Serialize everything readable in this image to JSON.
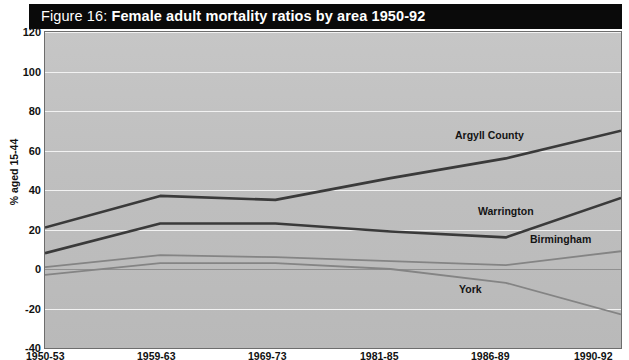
{
  "figure": {
    "title_prefix": "Figure 16: ",
    "title_main": "Female adult mortality ratios by area 1950-92"
  },
  "axes": {
    "y_axis_title": "% aged 15-44",
    "y_ticks": [
      "120",
      "100",
      "80",
      "60",
      "40",
      "20",
      "0",
      "-20",
      "-40"
    ],
    "x_ticks": [
      "1950-53",
      "1959-63",
      "1969-73",
      "1981-85",
      "1986-89",
      "1990-92"
    ]
  },
  "series_labels": {
    "argyll": "Argyll County",
    "warrington": "Warrington",
    "birmingham": "Birmingham",
    "york": "York"
  },
  "colors": {
    "plot_background": "#c0c0c0",
    "gridline": "#f2f2f2",
    "zero_line": "#909090",
    "frame": "#6d6d6d",
    "banner": "#0a0a0a",
    "banner_text": "#ffffff",
    "dark_series": "#3a3a3a",
    "mid_series": "#808080"
  },
  "chart_data": {
    "type": "line",
    "title": "Figure 16: Female adult mortality ratios by area 1950-92",
    "xlabel": "",
    "ylabel": "% aged 15-44",
    "categories": [
      "1950-53",
      "1959-63",
      "1969-73",
      "1981-85",
      "1986-89",
      "1990-92"
    ],
    "ylim": [
      -40,
      120
    ],
    "ytick_step": 20,
    "grid": true,
    "legend": "inline-labels",
    "series": [
      {
        "name": "Argyll County",
        "values": [
          21,
          37,
          35,
          46,
          56,
          70
        ],
        "color": "#3a3a3a",
        "width": 2.6
      },
      {
        "name": "Warrington",
        "values": [
          8,
          23,
          23,
          19,
          16,
          36
        ],
        "color": "#3a3a3a",
        "width": 2.6
      },
      {
        "name": "Birmingham",
        "values": [
          1,
          7,
          6,
          4,
          2,
          9
        ],
        "color": "#848484",
        "width": 1.8
      },
      {
        "name": "York",
        "values": [
          -3,
          3,
          3,
          0,
          -7,
          -23
        ],
        "color": "#848484",
        "width": 1.8
      }
    ]
  }
}
